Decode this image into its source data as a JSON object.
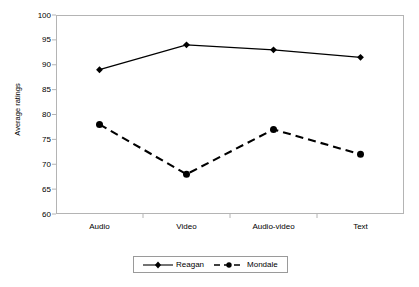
{
  "chart_data": {
    "type": "line",
    "title": "",
    "xlabel": "",
    "ylabel": "Average ratings",
    "categories": [
      "Audio",
      "Video",
      "Audio-video",
      "Text"
    ],
    "ylim": [
      60,
      100
    ],
    "yticks": [
      60,
      65,
      70,
      75,
      80,
      85,
      90,
      95,
      100
    ],
    "grid": false,
    "legend_position": "bottom-center",
    "series": [
      {
        "name": "Reagan",
        "values": [
          89,
          94,
          93,
          91.5
        ],
        "line_style": "solid",
        "marker": "diamond",
        "color": "#000000"
      },
      {
        "name": "Mondale",
        "values": [
          78,
          68,
          77,
          72
        ],
        "line_style": "dashed",
        "marker": "circle",
        "color": "#000000"
      }
    ]
  },
  "axes": {
    "y_title": "Average ratings",
    "y_labels": [
      "100",
      "95",
      "90",
      "85",
      "80",
      "75",
      "70",
      "65",
      "60"
    ],
    "x_labels": [
      "Audio",
      "Video",
      "Audio-video",
      "Text"
    ]
  },
  "legend": {
    "entries": [
      {
        "label": "Reagan",
        "marker": "diamond-marker",
        "line": "solid"
      },
      {
        "label": "Mondale",
        "marker": "circle-marker",
        "line": "dashed"
      }
    ]
  },
  "colors": {
    "series": "#000000",
    "frame": "#b4b4b4",
    "legend_border": "#9a9a9a",
    "background": "#ffffff"
  }
}
